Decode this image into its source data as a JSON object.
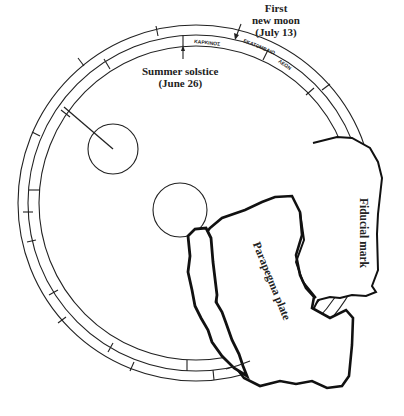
{
  "diagram": {
    "type": "annotated schematic of a circular calendar dial with fragments",
    "colors": {
      "ink": "#222222",
      "background": "#ffffff"
    },
    "labels": {
      "first_new_moon_line1": "First",
      "first_new_moon_line2": "new moon",
      "first_new_moon_line3": "(July 13)",
      "summer_solstice_line1": "Summer solstice",
      "summer_solstice_line2": "(June 26)",
      "parapegma_plate": "Parapegma plate",
      "fiducial_mark": "Fiducial mark"
    },
    "ring_inscriptions": {
      "karkinos": "ΚΑΡΚΙΝΟΣ",
      "hekatombaion": "ΕΚΑΤΟΜΒΑΙΩ",
      "leo": "ΛΕΩΝ",
      "ring_lower_1": "ΠΑΡΘΕΝΟΣ",
      "ring_lower_2": "ΧΗΛΑΙ",
      "ring_lower_3": "ΤΑΥΡΟΣ"
    },
    "elements": [
      "outer calendar ring (three concentric circles with division ticks)",
      "small upper-left circle with pointer",
      "central circle",
      "parapegma plate fragment",
      "fiducial mark fragment"
    ]
  }
}
